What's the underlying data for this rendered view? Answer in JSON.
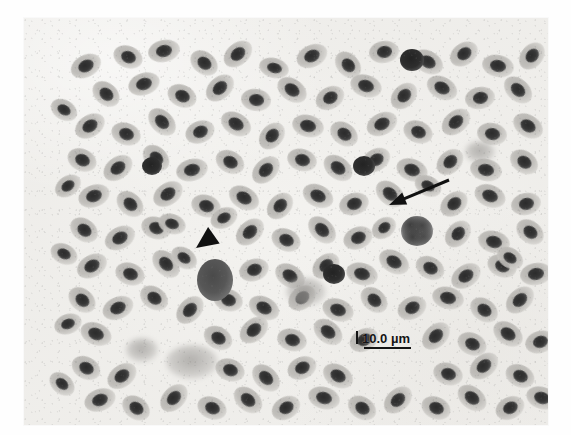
{
  "figure": {
    "kind": "light-microscopy-blood-smear",
    "modality": "grayscale brightfield photomicrograph",
    "specimen_description": "Peripheral blood smear showing densely packed elliptical nucleated erythrocytes",
    "plate": {
      "x": 24,
      "y": 18,
      "width": 524,
      "height": 407
    },
    "background_color": "#f2f1ee",
    "cell_body_color": "#bcbab6",
    "nucleus_color": "#333333",
    "annotation_color": "#111111",
    "page_background": "#ffffff"
  },
  "scale_bar": {
    "label": "10.0 µm",
    "value": 10.0,
    "unit": "µm",
    "tick_present": true,
    "bar_length_px": 47,
    "position": {
      "x": 356,
      "y": 332
    },
    "text_color": "#141414"
  },
  "annotations": [
    {
      "name": "arrowhead-marker",
      "glyph": "solid-triangle-arrowhead",
      "direction": "down-left",
      "points_to": "large darkly stained mononuclear leukocyte",
      "tip": {
        "x": 196,
        "y": 248
      },
      "tail": {
        "x": 224,
        "y": 228
      },
      "color": "#111111"
    },
    {
      "name": "arrow-marker",
      "glyph": "line-arrow-with-filled-head",
      "direction": "down-left",
      "points_to": "granulocyte with lobed mottled nucleus",
      "tip": {
        "x": 389,
        "y": 205
      },
      "tail": {
        "x": 449,
        "y": 180
      },
      "color": "#111111"
    }
  ],
  "marked_cells": [
    {
      "name": "arrowhead-target-cell",
      "type": "dark mononuclear leukocyte",
      "cx": 191,
      "cy": 262,
      "rx": 18,
      "ry": 21
    },
    {
      "name": "arrow-target-cell",
      "type": "granulocyte",
      "cx": 393,
      "cy": 213,
      "rx": 16,
      "ry": 15
    }
  ],
  "erythrocytes": [
    [
      62,
      48,
      16,
      11,
      -28
    ],
    [
      104,
      39,
      15,
      11,
      22
    ],
    [
      140,
      33,
      16,
      11,
      -12
    ],
    [
      180,
      45,
      15,
      11,
      38
    ],
    [
      214,
      36,
      16,
      11,
      -40
    ],
    [
      250,
      50,
      15,
      10,
      15
    ],
    [
      288,
      38,
      16,
      11,
      -25
    ],
    [
      324,
      47,
      15,
      11,
      48
    ],
    [
      360,
      34,
      15,
      11,
      -8
    ],
    [
      404,
      44,
      16,
      11,
      30
    ],
    [
      440,
      36,
      15,
      11,
      -35
    ],
    [
      474,
      48,
      16,
      11,
      12
    ],
    [
      508,
      38,
      15,
      11,
      -50
    ],
    [
      82,
      76,
      15,
      11,
      40
    ],
    [
      120,
      66,
      16,
      11,
      -18
    ],
    [
      158,
      78,
      15,
      11,
      25
    ],
    [
      196,
      70,
      16,
      11,
      -42
    ],
    [
      232,
      82,
      15,
      11,
      8
    ],
    [
      268,
      72,
      16,
      11,
      35
    ],
    [
      306,
      80,
      15,
      11,
      -28
    ],
    [
      342,
      68,
      16,
      11,
      18
    ],
    [
      380,
      78,
      15,
      11,
      -45
    ],
    [
      418,
      70,
      16,
      11,
      28
    ],
    [
      456,
      80,
      15,
      11,
      -10
    ],
    [
      494,
      72,
      16,
      11,
      42
    ],
    [
      66,
      108,
      16,
      11,
      -32
    ],
    [
      102,
      116,
      15,
      11,
      20
    ],
    [
      138,
      104,
      16,
      11,
      45
    ],
    [
      176,
      114,
      15,
      11,
      -22
    ],
    [
      212,
      106,
      16,
      11,
      30
    ],
    [
      248,
      118,
      15,
      11,
      -48
    ],
    [
      284,
      108,
      16,
      11,
      14
    ],
    [
      320,
      116,
      15,
      11,
      36
    ],
    [
      358,
      106,
      16,
      11,
      -26
    ],
    [
      394,
      114,
      15,
      11,
      22
    ],
    [
      432,
      104,
      16,
      11,
      -40
    ],
    [
      468,
      116,
      15,
      11,
      10
    ],
    [
      504,
      108,
      16,
      11,
      32
    ],
    [
      58,
      142,
      15,
      11,
      24
    ],
    [
      94,
      150,
      16,
      11,
      -36
    ],
    [
      132,
      140,
      15,
      11,
      44
    ],
    [
      168,
      152,
      16,
      11,
      -14
    ],
    [
      206,
      144,
      15,
      11,
      28
    ],
    [
      242,
      152,
      16,
      11,
      -44
    ],
    [
      278,
      142,
      15,
      11,
      16
    ],
    [
      314,
      150,
      16,
      11,
      38
    ],
    [
      352,
      142,
      15,
      11,
      -30
    ],
    [
      388,
      152,
      16,
      11,
      20
    ],
    [
      426,
      144,
      15,
      11,
      -42
    ],
    [
      462,
      152,
      16,
      11,
      12
    ],
    [
      500,
      144,
      15,
      11,
      34
    ],
    [
      70,
      178,
      16,
      11,
      -20
    ],
    [
      106,
      186,
      15,
      11,
      42
    ],
    [
      144,
      176,
      16,
      11,
      -34
    ],
    [
      182,
      188,
      15,
      11,
      18
    ],
    [
      220,
      180,
      16,
      11,
      30
    ],
    [
      256,
      188,
      15,
      11,
      -46
    ],
    [
      294,
      178,
      16,
      11,
      26
    ],
    [
      330,
      186,
      15,
      11,
      -16
    ],
    [
      366,
      176,
      16,
      11,
      40
    ],
    [
      430,
      186,
      15,
      11,
      -38
    ],
    [
      466,
      178,
      16,
      11,
      22
    ],
    [
      502,
      186,
      15,
      11,
      -12
    ],
    [
      60,
      212,
      15,
      11,
      36
    ],
    [
      96,
      220,
      16,
      11,
      -28
    ],
    [
      132,
      210,
      15,
      11,
      18
    ],
    [
      226,
      214,
      16,
      11,
      -42
    ],
    [
      262,
      222,
      15,
      11,
      24
    ],
    [
      298,
      212,
      16,
      11,
      44
    ],
    [
      334,
      220,
      15,
      11,
      -22
    ],
    [
      370,
      244,
      16,
      11,
      30
    ],
    [
      434,
      216,
      15,
      11,
      -48
    ],
    [
      470,
      224,
      16,
      11,
      14
    ],
    [
      506,
      214,
      15,
      11,
      38
    ],
    [
      68,
      248,
      16,
      11,
      -30
    ],
    [
      106,
      256,
      15,
      11,
      20
    ],
    [
      142,
      246,
      16,
      11,
      46
    ],
    [
      230,
      252,
      15,
      11,
      -18
    ],
    [
      266,
      258,
      16,
      11,
      32
    ],
    [
      302,
      248,
      15,
      11,
      -40
    ],
    [
      338,
      256,
      16,
      11,
      16
    ],
    [
      406,
      250,
      15,
      11,
      28
    ],
    [
      442,
      258,
      16,
      11,
      -34
    ],
    [
      478,
      248,
      15,
      11,
      22
    ],
    [
      512,
      256,
      16,
      11,
      -10
    ],
    [
      58,
      282,
      15,
      11,
      40
    ],
    [
      94,
      290,
      16,
      11,
      -24
    ],
    [
      130,
      280,
      15,
      11,
      34
    ],
    [
      166,
      292,
      16,
      11,
      -46
    ],
    [
      204,
      282,
      15,
      11,
      18
    ],
    [
      240,
      290,
      16,
      11,
      28
    ],
    [
      278,
      280,
      15,
      11,
      -38
    ],
    [
      314,
      292,
      16,
      11,
      20
    ],
    [
      350,
      282,
      15,
      11,
      42
    ],
    [
      388,
      290,
      15,
      11,
      -26
    ],
    [
      424,
      280,
      16,
      11,
      14
    ],
    [
      460,
      292,
      15,
      11,
      36
    ],
    [
      496,
      282,
      16,
      11,
      -42
    ],
    [
      72,
      316,
      16,
      11,
      22
    ],
    [
      194,
      320,
      15,
      11,
      30
    ],
    [
      230,
      312,
      16,
      11,
      -40
    ],
    [
      268,
      322,
      15,
      11,
      16
    ],
    [
      304,
      314,
      16,
      11,
      38
    ],
    [
      340,
      322,
      15,
      11,
      -28
    ],
    [
      412,
      318,
      16,
      11,
      -44
    ],
    [
      448,
      326,
      15,
      11,
      24
    ],
    [
      484,
      316,
      16,
      11,
      34
    ],
    [
      516,
      324,
      15,
      11,
      -18
    ],
    [
      62,
      350,
      15,
      11,
      28
    ],
    [
      98,
      358,
      16,
      11,
      -36
    ],
    [
      206,
      352,
      15,
      11,
      20
    ],
    [
      242,
      360,
      16,
      11,
      44
    ],
    [
      278,
      350,
      15,
      11,
      -24
    ],
    [
      314,
      358,
      16,
      11,
      30
    ],
    [
      424,
      356,
      15,
      11,
      18
    ],
    [
      460,
      348,
      16,
      11,
      -40
    ],
    [
      496,
      358,
      15,
      11,
      26
    ],
    [
      76,
      382,
      16,
      11,
      -20
    ],
    [
      112,
      390,
      15,
      11,
      36
    ],
    [
      150,
      380,
      16,
      11,
      -46
    ],
    [
      188,
      390,
      15,
      11,
      22
    ],
    [
      224,
      382,
      16,
      11,
      40
    ],
    [
      262,
      390,
      15,
      11,
      -30
    ],
    [
      300,
      380,
      16,
      11,
      16
    ],
    [
      338,
      390,
      15,
      11,
      32
    ],
    [
      374,
      382,
      16,
      11,
      -42
    ],
    [
      412,
      390,
      15,
      11,
      24
    ],
    [
      448,
      380,
      16,
      11,
      38
    ],
    [
      486,
      390,
      15,
      11,
      -26
    ],
    [
      518,
      380,
      16,
      11,
      18
    ],
    [
      40,
      92,
      14,
      10,
      30
    ],
    [
      44,
      168,
      14,
      10,
      -34
    ],
    [
      40,
      236,
      14,
      10,
      26
    ],
    [
      44,
      306,
      14,
      10,
      -20
    ],
    [
      38,
      366,
      14,
      10,
      40
    ],
    [
      160,
      240,
      14,
      10,
      34
    ],
    [
      200,
      200,
      14,
      10,
      -26
    ],
    [
      404,
      168,
      14,
      10,
      28
    ],
    [
      360,
      210,
      13,
      10,
      -36
    ],
    [
      148,
      206,
      14,
      10,
      18
    ],
    [
      486,
      240,
      14,
      10,
      32
    ]
  ],
  "special_cells": [
    {
      "cls": "tiny-dark",
      "cx": 388,
      "cy": 42,
      "rx": 12,
      "ry": 11
    },
    {
      "cls": "tiny-dark",
      "cx": 340,
      "cy": 148,
      "rx": 11,
      "ry": 10
    },
    {
      "cls": "tiny-dark",
      "cx": 310,
      "cy": 256,
      "rx": 11,
      "ry": 10
    },
    {
      "cls": "tiny-dark",
      "cx": 128,
      "cy": 148,
      "rx": 10,
      "ry": 9
    },
    {
      "cls": "smudge",
      "cx": 168,
      "cy": 344,
      "rx": 26,
      "ry": 17
    },
    {
      "cls": "smudge",
      "cx": 282,
      "cy": 274,
      "rx": 20,
      "ry": 14
    },
    {
      "cls": "smudge",
      "cx": 118,
      "cy": 332,
      "rx": 16,
      "ry": 12
    },
    {
      "cls": "smudge",
      "cx": 456,
      "cy": 134,
      "rx": 15,
      "ry": 11
    }
  ]
}
